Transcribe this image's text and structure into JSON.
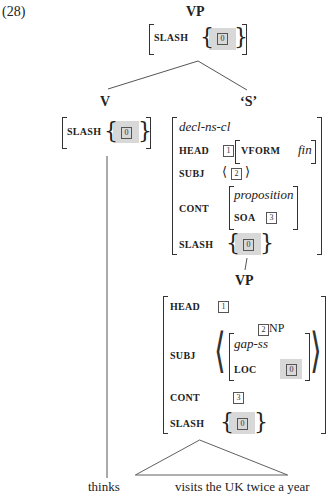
{
  "example_number": "(28)",
  "root": {
    "label": "VP",
    "avm": {
      "slash_feature": "SLASH",
      "slash_tag": "0"
    }
  },
  "left_daughter": {
    "label": "V",
    "avm": {
      "slash_feature": "SLASH",
      "slash_tag": "0"
    },
    "word": "thinks"
  },
  "right_daughter": {
    "label": "‘S’",
    "avm": {
      "type": "decl-ns-cl",
      "head_feature": "HEAD",
      "head_tag": "1",
      "vform_feature": "VFORM",
      "vform_value": "fin",
      "subj_feature": "SUBJ",
      "subj_tag": "2",
      "cont_feature": "CONT",
      "cont_type": "proposition",
      "soa_feature": "SOA",
      "soa_tag": "3",
      "slash_feature": "SLASH",
      "slash_tag": "0"
    }
  },
  "vp_node": {
    "label": "VP",
    "avm": {
      "head_feature": "HEAD",
      "head_tag": "1",
      "subj_feature": "SUBJ",
      "subj_np_tag": "2",
      "subj_np_label": "NP",
      "subj_type": "gap-ss",
      "loc_feature": "LOC",
      "loc_tag": "0",
      "cont_feature": "CONT",
      "cont_tag": "3",
      "slash_feature": "SLASH",
      "slash_tag": "0"
    },
    "phrase": "visits the UK twice a year"
  }
}
